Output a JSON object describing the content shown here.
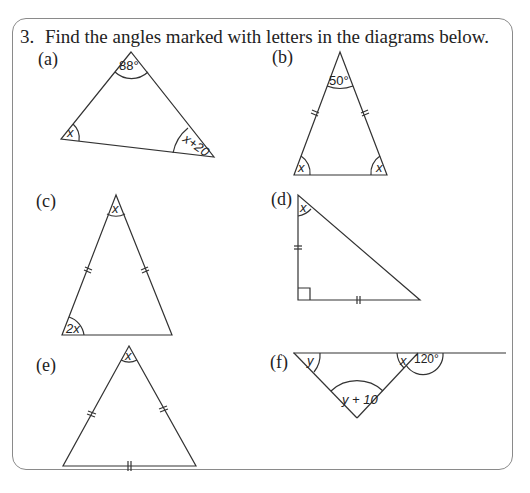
{
  "question": {
    "number": "3.",
    "text": "Find the angles marked with letters in the diagrams below."
  },
  "parts": [
    {
      "id": "a",
      "label": "(a)",
      "angles": [
        "88°",
        "x",
        "x+20"
      ]
    },
    {
      "id": "b",
      "label": "(b)",
      "angles": [
        "50°",
        "x",
        "x"
      ],
      "equal_sides_marks": 2
    },
    {
      "id": "c",
      "label": "(c)",
      "angles": [
        "x",
        "2x"
      ],
      "equal_sides_marks": 2
    },
    {
      "id": "d",
      "label": "(d)",
      "angles": [
        "x"
      ],
      "right_angle": true,
      "equal_sides_marks": 2
    },
    {
      "id": "e",
      "label": "(e)",
      "angles": [
        "x"
      ],
      "equal_sides_marks": 2,
      "base_mark": true
    },
    {
      "id": "f",
      "label": "(f)",
      "angles": [
        "y",
        "x",
        "120°",
        "y + 10"
      ]
    }
  ],
  "colors": {
    "line": "#333333",
    "frame": "#8a8a8a",
    "text": "#222222"
  }
}
